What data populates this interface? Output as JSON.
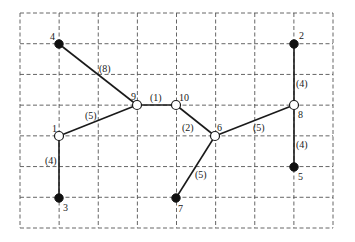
{
  "diagram": {
    "type": "tree-graph-on-grid",
    "grid": {
      "x0": 20,
      "y0": 13,
      "x1": 333,
      "y1": 228,
      "columns": 8,
      "rows": 7,
      "line_color": "#555555",
      "style": "dashed"
    },
    "nodes": [
      {
        "id": "1",
        "label": "1",
        "x": 59,
        "y": 136,
        "kind": "open",
        "label_dx": -7,
        "label_dy": -4
      },
      {
        "id": "2",
        "label": "2",
        "x": 294,
        "y": 44,
        "kind": "filled",
        "label_dx": 5,
        "label_dy": -5
      },
      {
        "id": "3",
        "label": "3",
        "x": 59,
        "y": 198,
        "kind": "filled",
        "label_dx": 4,
        "label_dy": 13
      },
      {
        "id": "4",
        "label": "4",
        "x": 59,
        "y": 44,
        "kind": "filled",
        "label_dx": -9,
        "label_dy": -4
      },
      {
        "id": "5",
        "label": "5",
        "x": 294,
        "y": 167,
        "kind": "filled",
        "label_dx": 4,
        "label_dy": 13
      },
      {
        "id": "6",
        "label": "6",
        "x": 215,
        "y": 136,
        "kind": "open",
        "label_dx": 2,
        "label_dy": -5
      },
      {
        "id": "7",
        "label": "7",
        "x": 176,
        "y": 198,
        "kind": "filled",
        "label_dx": 2,
        "label_dy": 14
      },
      {
        "id": "8",
        "label": "8",
        "x": 294,
        "y": 105,
        "kind": "open",
        "label_dx": 4,
        "label_dy": 13
      },
      {
        "id": "9",
        "label": "9",
        "x": 137,
        "y": 105,
        "kind": "open",
        "label_dx": -6,
        "label_dy": -5
      },
      {
        "id": "10",
        "label": "10",
        "x": 176,
        "y": 105,
        "kind": "open",
        "label_dx": 3,
        "label_dy": -4
      }
    ],
    "edges": [
      {
        "from": "4",
        "to": "9",
        "weight_label": "(8)",
        "lx": 99,
        "ly": 72
      },
      {
        "from": "9",
        "to": "10",
        "weight_label": "(1)",
        "lx": 150,
        "ly": 101
      },
      {
        "from": "9",
        "to": "1",
        "weight_label": "(5)",
        "lx": 85,
        "ly": 119
      },
      {
        "from": "1",
        "to": "3",
        "weight_label": "(4)",
        "lx": 45,
        "ly": 164
      },
      {
        "from": "10",
        "to": "6",
        "weight_label": "(2)",
        "lx": 182,
        "ly": 131
      },
      {
        "from": "6",
        "to": "8",
        "weight_label": "(5)",
        "lx": 253,
        "ly": 131
      },
      {
        "from": "6",
        "to": "7",
        "weight_label": "(5)",
        "lx": 195,
        "ly": 178
      },
      {
        "from": "2",
        "to": "8",
        "weight_label": "(4)",
        "lx": 296,
        "ly": 87
      },
      {
        "from": "8",
        "to": "5",
        "weight_label": "(4)",
        "lx": 296,
        "ly": 148
      }
    ],
    "colors": {
      "edge": "#1a1a1a",
      "filled_node": "#111111",
      "open_node_fill": "#ffffff",
      "background": "#ffffff"
    }
  }
}
